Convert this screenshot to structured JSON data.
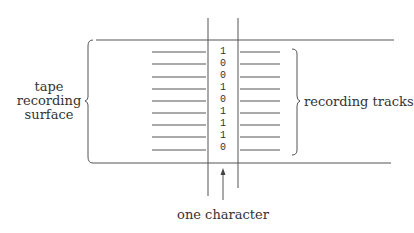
{
  "diagram": {
    "labels": {
      "left": [
        "tape",
        "recording",
        "surface"
      ],
      "right": "recording tracks",
      "bottom": "one character"
    },
    "bits": [
      "1",
      "0",
      "0",
      "1",
      "0",
      "1",
      "1",
      "1",
      "0"
    ],
    "track_count": 9,
    "colors": {
      "line": "#555555",
      "text": "#333333",
      "background": "#ffffff"
    }
  }
}
